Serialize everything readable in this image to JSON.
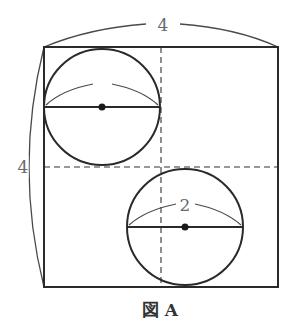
{
  "diagram": {
    "type": "geometry",
    "caption": "図 A",
    "square": {
      "side_length_label": "4",
      "top_dimension_label": "4",
      "left_dimension_label": "4"
    },
    "circles": [
      {
        "id": "upper-left",
        "diameter_label": ""
      },
      {
        "id": "lower-right",
        "diameter_label": "2"
      }
    ],
    "guides": {
      "vertical_midline": "dashed",
      "horizontal_midline": "dashed"
    },
    "colors": {
      "stroke": "#2a2a2a",
      "thin_stroke": "#4a4a4a",
      "label": "#6a6a6a",
      "background": "#ffffff"
    }
  }
}
